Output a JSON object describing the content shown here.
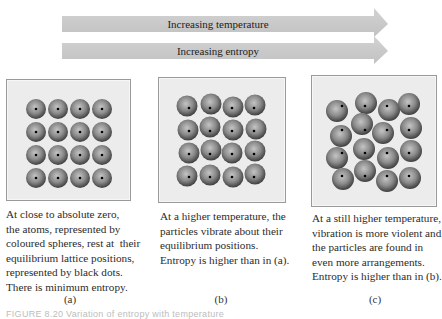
{
  "arrows": [
    {
      "label": "Increasing temperature"
    },
    {
      "label": "Increasing entropy"
    }
  ],
  "panels": [
    {
      "id": "a",
      "label": "(a)",
      "caption_lines": [
        "At close to absolute zero,",
        "the atoms, represented by",
        "coloured spheres, rest at  their",
        "equilibrium lattice positions,",
        "represented by black dots.",
        "There is minimum entropy."
      ]
    },
    {
      "id": "b",
      "label": "(b)",
      "caption_lines": [
        "At a higher temperature, the",
        "particles vibrate about their",
        "equilibrium positions.",
        "Entropy is higher than in (a)."
      ]
    },
    {
      "id": "c",
      "label": "(c)",
      "caption_lines": [
        "At a still higher temperature,",
        "vibration is more violent and",
        "the particles are found in",
        "even more arrangements.",
        "Entropy is higher than in (b)."
      ]
    }
  ],
  "figure_caption": "FIGURE 8.20 Variation of entropy with temperature",
  "colors": {
    "arrow_fill": "#c9c9c9",
    "panel_bg": "#ececec",
    "sphere_light": "#b8b8b8",
    "sphere_dark": "#4a4a4a",
    "dot": "#000000"
  }
}
